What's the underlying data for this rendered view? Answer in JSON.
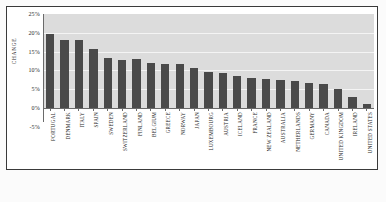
{
  "chart_data": {
    "type": "bar",
    "title": "",
    "xlabel": "",
    "ylabel": "CHANGE",
    "ylim": [
      -5,
      25
    ],
    "ytick_labels": [
      "25%",
      "20%",
      "15%",
      "10%",
      "5%",
      "0%",
      "-5%"
    ],
    "ytick_values": [
      25,
      20,
      15,
      10,
      5,
      0,
      -5
    ],
    "grid": true,
    "legend": "none",
    "categories": [
      "PORTUGAL",
      "DENMARK",
      "ITALY",
      "SPAIN",
      "SWEDEN",
      "SWITZERLAND",
      "FINLAND",
      "BELGIUM",
      "GREECE",
      "NORWAY",
      "JAPAN",
      "LUXEMBOURG",
      "AUSTRIA",
      "ICELAND",
      "FRANCE",
      "NEW ZEALAND",
      "AUSTRALIA",
      "NETHERLANDS",
      "GERMANY",
      "CANADA",
      "UNITED KINGDOM",
      "IRELAND",
      "UNITED STATES"
    ],
    "values": [
      19.8,
      18.2,
      18.0,
      15.6,
      13.2,
      12.9,
      13.0,
      12.1,
      11.6,
      11.8,
      10.6,
      9.6,
      9.3,
      8.6,
      8.1,
      7.6,
      7.4,
      7.1,
      6.6,
      6.3,
      5.0,
      2.8,
      1.0
    ],
    "bar_color": "#4a4a4a",
    "plot_background": "#dcdcdc",
    "gridline_color": "#f4f4f4"
  }
}
